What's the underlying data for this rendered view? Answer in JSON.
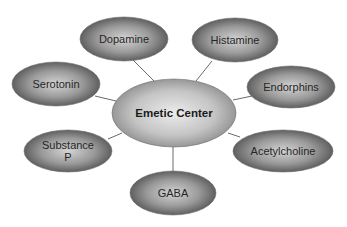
{
  "diagram": {
    "type": "hub-and-spoke",
    "center": {
      "label": "Emetic Center",
      "cx": 174,
      "cy": 113,
      "rx": 62,
      "ry": 34
    },
    "nodes": [
      {
        "id": "dopamine",
        "label_lines": [
          "Dopamine"
        ],
        "cx": 124,
        "cy": 39,
        "rx": 44,
        "ry": 22,
        "line": {
          "x1": 133,
          "y1": 60,
          "x2": 154,
          "y2": 81
        }
      },
      {
        "id": "histamine",
        "label_lines": [
          "Histamine"
        ],
        "cx": 235,
        "cy": 40,
        "rx": 43,
        "ry": 22,
        "line": {
          "x1": 212,
          "y1": 61,
          "x2": 196,
          "y2": 81
        }
      },
      {
        "id": "serotonin",
        "label_lines": [
          "Serotonin"
        ],
        "cx": 56,
        "cy": 84,
        "rx": 44,
        "ry": 22,
        "line": {
          "x1": 95,
          "y1": 96,
          "x2": 116,
          "y2": 101
        }
      },
      {
        "id": "endorphins",
        "label_lines": [
          "Endorphins"
        ],
        "cx": 291,
        "cy": 87,
        "rx": 44,
        "ry": 21,
        "line": {
          "x1": 252,
          "y1": 96,
          "x2": 233,
          "y2": 100
        }
      },
      {
        "id": "substance-p",
        "label_lines": [
          "Substance",
          "P"
        ],
        "cx": 68,
        "cy": 151,
        "rx": 44,
        "ry": 21,
        "line": {
          "x1": 108,
          "y1": 139,
          "x2": 122,
          "y2": 133
        }
      },
      {
        "id": "acetylcholine",
        "label_lines": [
          "Acetylcholine"
        ],
        "cx": 283,
        "cy": 151,
        "rx": 50,
        "ry": 21,
        "line": {
          "x1": 240,
          "y1": 137,
          "x2": 228,
          "y2": 133
        }
      },
      {
        "id": "gaba",
        "label_lines": [
          "GABA"
        ],
        "cx": 173,
        "cy": 193,
        "rx": 43,
        "ry": 22,
        "line": {
          "x1": 173,
          "y1": 147,
          "x2": 173,
          "y2": 172
        }
      }
    ],
    "colors": {
      "node_center": "#d4d4d4",
      "node_edge": "#505050",
      "hub_center": "#ececec",
      "hub_edge": "#8a8a8a",
      "connector": "#6a6a6a",
      "text": "#262626"
    }
  }
}
